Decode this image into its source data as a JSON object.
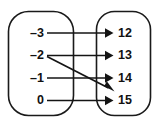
{
  "diagram": {
    "type": "mapping-diagram",
    "domain": {
      "label": "domain-oval",
      "values": [
        "–3",
        "–2",
        "–1",
        "0"
      ]
    },
    "range": {
      "label": "range-oval",
      "values": [
        "12",
        "13",
        "14",
        "15"
      ]
    },
    "mappings": [
      {
        "from": "–3",
        "to": "12",
        "style": "horizontal"
      },
      {
        "from": "–2",
        "to": "13",
        "style": "horizontal"
      },
      {
        "from": "–2",
        "to": "15",
        "style": "diagonal"
      },
      {
        "from": "–1",
        "to": "14",
        "style": "horizontal"
      },
      {
        "from": "0",
        "to": "15",
        "style": "horizontal"
      }
    ],
    "colors": {
      "stroke": "#1a1a1a",
      "line": "#141414",
      "text": "#111111",
      "background": "#ffffff"
    }
  }
}
